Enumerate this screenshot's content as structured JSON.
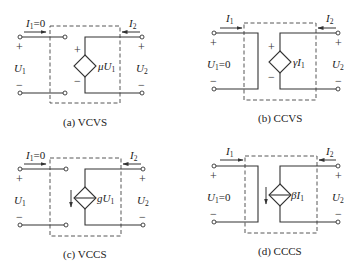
{
  "figure": {
    "panels": [
      {
        "id": "a",
        "caption": "(a) VCVS",
        "input_current": "I",
        "input_current_sub": "1",
        "input_current_suffix": "=0",
        "output_current": "I",
        "output_current_sub": "2",
        "input_voltage": "U",
        "input_voltage_sub": "1",
        "input_voltage_suffix": "",
        "output_voltage": "U",
        "output_voltage_sub": "2",
        "source_type": "voltage",
        "source_coeff": "μU",
        "source_coeff_sub": "1",
        "plus": "+",
        "minus": "−"
      },
      {
        "id": "b",
        "caption": "(b) CCVS",
        "input_current": "I",
        "input_current_sub": "1",
        "input_current_suffix": "",
        "output_current": "I",
        "output_current_sub": "2",
        "input_voltage": "U",
        "input_voltage_sub": "1",
        "input_voltage_suffix": "=0",
        "output_voltage": "U",
        "output_voltage_sub": "2",
        "source_type": "voltage",
        "source_coeff": "γI",
        "source_coeff_sub": "1",
        "plus": "+",
        "minus": "−"
      },
      {
        "id": "c",
        "caption": "(c) VCCS",
        "input_current": "I",
        "input_current_sub": "1",
        "input_current_suffix": "=0",
        "output_current": "I",
        "output_current_sub": "2",
        "input_voltage": "U",
        "input_voltage_sub": "1",
        "input_voltage_suffix": "",
        "output_voltage": "U",
        "output_voltage_sub": "2",
        "source_type": "current",
        "source_coeff": "gU",
        "source_coeff_sub": "1",
        "plus": "+",
        "minus": "−"
      },
      {
        "id": "d",
        "caption": "(d) CCCS",
        "input_current": "I",
        "input_current_sub": "1",
        "input_current_suffix": "",
        "output_current": "I",
        "output_current_sub": "2",
        "input_voltage": "U",
        "input_voltage_sub": "1",
        "input_voltage_suffix": "=0",
        "output_voltage": "U",
        "output_voltage_sub": "2",
        "source_type": "current",
        "source_coeff": "βI",
        "source_coeff_sub": "1",
        "plus": "+",
        "minus": "−"
      }
    ]
  }
}
